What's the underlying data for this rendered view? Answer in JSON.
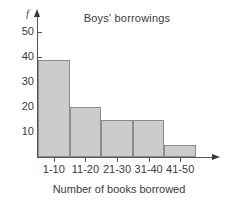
{
  "chart_data": {
    "type": "bar",
    "title": "Boys' borrowings",
    "xlabel": "Number of books borrowed",
    "ylabel": "f",
    "categories": [
      "1-10",
      "11-20",
      "21-30",
      "31-40",
      "41-50"
    ],
    "values": [
      39,
      20,
      15,
      15,
      5
    ],
    "ylim": [
      0,
      55
    ],
    "yticks": [
      10,
      20,
      30,
      40,
      50
    ],
    "ytick_labels": [
      "10",
      "20",
      "30",
      "40",
      "50"
    ],
    "grid": false,
    "legend": false,
    "bar_fill": "#cccccc",
    "bar_stroke": "#8c8c8c",
    "axis_color": "#555555",
    "text_color": "#3b3b3b",
    "background": "#ffffff"
  }
}
